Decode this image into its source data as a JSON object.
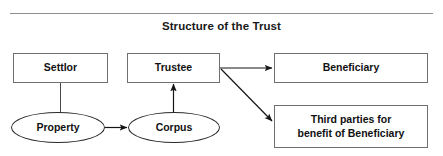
{
  "figure": {
    "title": "Structure of the Trust",
    "has_top_rule": true,
    "line_color": "#2a2a2a",
    "box_border_color": "#6f6f6f",
    "rule_color": "#8d8d8d",
    "text_color": "#111111",
    "background": "#ffffff"
  },
  "nodes": {
    "settlor": {
      "label": "Settlor",
      "shape": "rectangle"
    },
    "trustee": {
      "label": "Trustee",
      "shape": "rectangle"
    },
    "beneficiary": {
      "label": "Beneficiary",
      "shape": "rectangle"
    },
    "third_parties": {
      "label": "Third parties for\nbenefit of Beneficiary",
      "shape": "rectangle"
    },
    "property": {
      "label": "Property",
      "shape": "ellipse"
    },
    "corpus": {
      "label": "Corpus",
      "shape": "ellipse"
    }
  },
  "connectors": [
    {
      "from": "settlor",
      "to": "property",
      "style": "plain-line",
      "direction": "vertical"
    },
    {
      "from": "property",
      "to": "corpus",
      "style": "arrow",
      "direction": "horizontal-right"
    },
    {
      "from": "corpus",
      "to": "trustee",
      "style": "arrow",
      "direction": "vertical-up"
    },
    {
      "from": "trustee",
      "to": "beneficiary",
      "style": "arrow",
      "direction": "horizontal-right"
    },
    {
      "from": "trustee",
      "to": "third_parties",
      "style": "arrow",
      "direction": "diagonal-down-right"
    }
  ]
}
